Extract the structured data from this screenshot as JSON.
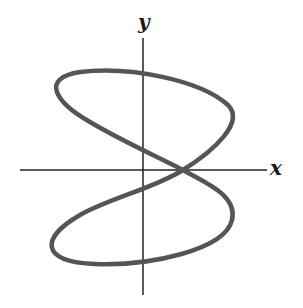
{
  "figure": {
    "axes": {
      "x_label": "x",
      "y_label": "y",
      "origin": [
        143,
        170
      ],
      "x_axis": {
        "from": [
          20,
          170
        ],
        "to": [
          267,
          170
        ]
      },
      "y_axis": {
        "from": [
          143,
          38
        ],
        "to": [
          143,
          295
        ]
      }
    },
    "curve": {
      "stroke_color": "#555555",
      "stroke_width": 4.5,
      "self_intersection": [
        183,
        170
      ],
      "path": "M 183 170 C 160 158, 120 140, 90 122 C 55 102, 40 78, 80 72 C 130 66, 200 80, 228 105 C 245 122, 215 150, 183 170 C 155 188, 110 198, 80 215 C 40 238, 40 262, 95 264 C 150 266, 225 250, 232 220 C 238 195, 205 183, 183 170 Z"
    },
    "colors": {
      "background": "#ffffff",
      "axis": "#222222",
      "curve": "#555555",
      "label": "#1a1a1a"
    }
  }
}
